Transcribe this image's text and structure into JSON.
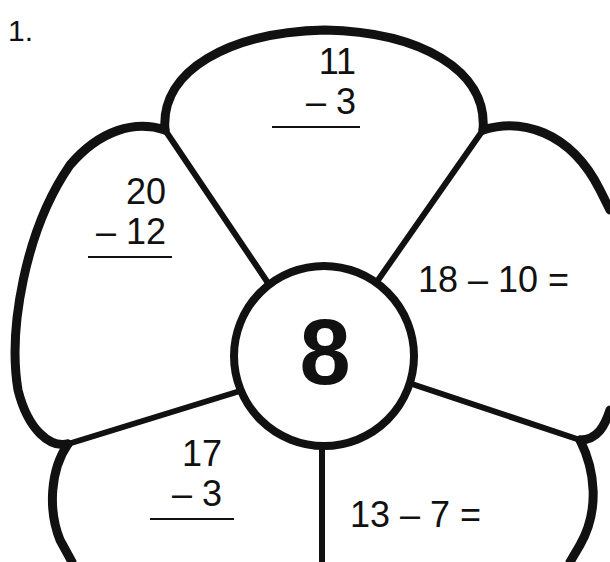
{
  "problem_number": "1.",
  "center": {
    "answer": "8"
  },
  "petals": [
    {
      "id": "top",
      "format": "vertical",
      "top": "11",
      "bottom": "– 3"
    },
    {
      "id": "upper-left",
      "format": "vertical",
      "top": "20",
      "bottom": "– 12"
    },
    {
      "id": "upper-right",
      "format": "horizontal",
      "expression": "18 – 10 ="
    },
    {
      "id": "lower-left",
      "format": "vertical",
      "top": "17",
      "bottom": "– 3"
    },
    {
      "id": "lower-right",
      "format": "horizontal",
      "expression": "13 – 7 ="
    }
  ],
  "colors": {
    "ink": "#111111",
    "paper": "#ffffff"
  }
}
